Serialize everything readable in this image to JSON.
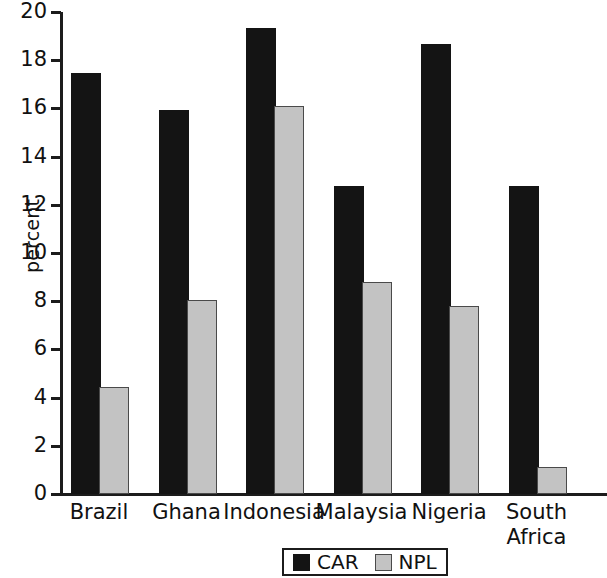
{
  "chart_data": {
    "type": "bar",
    "title": "",
    "subtitle": "",
    "xlabel": "",
    "ylabel": "percent",
    "ylim": [
      0,
      20
    ],
    "ytick_step": 2,
    "yticks": [
      "20",
      "18",
      "16",
      "14",
      "12",
      "10",
      "8",
      "6",
      "4",
      "2",
      "0"
    ],
    "grid": false,
    "legend_position": "bottom-center",
    "categories": [
      "Brazil",
      "Ghana",
      "Indonesia",
      "Malaysia",
      "Nigeria",
      "South\nAfrica"
    ],
    "series": [
      {
        "name": "CAR",
        "color": "#141414",
        "values": [
          17.4,
          15.85,
          19.25,
          12.7,
          18.6,
          12.7
        ]
      },
      {
        "name": "NPL",
        "color": "#c3c3c3",
        "values": [
          4.35,
          7.95,
          16.0,
          8.7,
          7.7,
          1.05
        ]
      }
    ]
  },
  "legend": {
    "items": [
      {
        "label": "CAR",
        "swatch": "black-square-swatch"
      },
      {
        "label": "NPL",
        "swatch": "gray-square-swatch"
      }
    ]
  }
}
